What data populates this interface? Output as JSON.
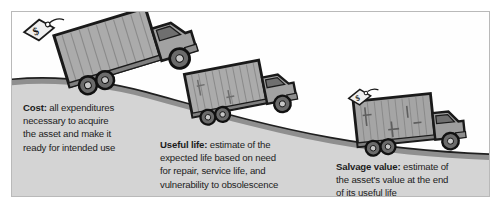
{
  "figure": {
    "background_color": "#ffffff",
    "frame_color": "#b9b9b9",
    "ground_color": "#d4d4d4",
    "sky_color": "#fefefe",
    "road_color": "#9a9a9a",
    "truck_body_color": "#a8a8a8",
    "truck_cab_color": "#a0a0a0",
    "outline_color": "#1a1a1a",
    "text_color": "#1c1c1c"
  },
  "callouts": [
    {
      "id": "cost",
      "label": "Cost:",
      "text": " all expenditures\nnecessary to acquire\nthe asset and make it\nready for intended use"
    },
    {
      "id": "useful-life",
      "label": "Useful life:",
      "text": " estimate of the\nexpected life based on need\nfor repair, service life, and\nvulnerability to obsolescence"
    },
    {
      "id": "salvage-value",
      "label": "Salvage value:",
      "text": " estimate of\nthe asset's value at the end\nof its useful life"
    }
  ],
  "scene": {
    "trucks": [
      {
        "id": "truck-new",
        "state": "new",
        "position": "hill-top-left",
        "has_price_tag": true,
        "price_tag_symbol": "$"
      },
      {
        "id": "truck-used",
        "state": "used",
        "position": "hill-middle",
        "has_price_tag": false,
        "price_tag_symbol": ""
      },
      {
        "id": "truck-old",
        "state": "worn",
        "position": "hill-bottom-right",
        "has_price_tag": true,
        "price_tag_symbol": "$"
      }
    ],
    "road": {
      "shape": "descending-hill-curve",
      "direction": "left-high-to-right-low"
    }
  }
}
